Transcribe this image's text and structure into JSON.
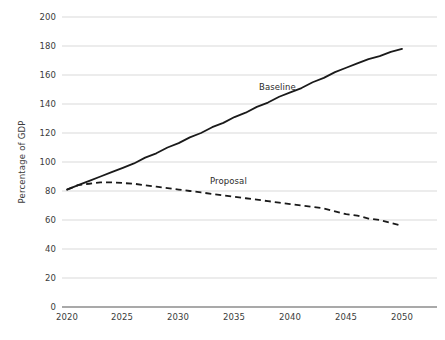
{
  "chart_data": {
    "type": "line",
    "title": "",
    "xlabel": "",
    "ylabel": "Percentage of GDP",
    "xlim": [
      2020,
      2050
    ],
    "ylim": [
      0,
      200
    ],
    "grid": true,
    "legend_position": "inline-annotation",
    "xticks": [
      "2020",
      "2025",
      "2030",
      "2035",
      "2040",
      "2045",
      "2050"
    ],
    "yticks": [
      "0",
      "20",
      "40",
      "60",
      "80",
      "100",
      "120",
      "140",
      "160",
      "180",
      "200"
    ],
    "x": [
      2020,
      2021,
      2022,
      2023,
      2024,
      2025,
      2026,
      2027,
      2028,
      2029,
      2030,
      2031,
      2032,
      2033,
      2034,
      2035,
      2036,
      2037,
      2038,
      2039,
      2040,
      2041,
      2042,
      2043,
      2044,
      2045,
      2046,
      2047,
      2048,
      2049,
      2050
    ],
    "series": [
      {
        "name": "Baseline",
        "style": "solid",
        "color": "#1a1a1a",
        "values": [
          81,
          84,
          87,
          90,
          93,
          96,
          99,
          103,
          106,
          110,
          113,
          117,
          120,
          124,
          127,
          131,
          134,
          138,
          141,
          145,
          148,
          151,
          155,
          158,
          162,
          165,
          168,
          171,
          173,
          176,
          178
        ]
      },
      {
        "name": "Proposal",
        "style": "dashed",
        "color": "#1a1a1a",
        "values": [
          81,
          84,
          85,
          86,
          86,
          85.5,
          85,
          84,
          83,
          82,
          81,
          80,
          79,
          78,
          77,
          76,
          75,
          74,
          73,
          72,
          71,
          70,
          69,
          68,
          66,
          64,
          63,
          61,
          60,
          58,
          56
        ]
      }
    ],
    "annotations": [
      {
        "text": "Baseline",
        "x_px": 259,
        "y_px": 82
      },
      {
        "text": "Proposal",
        "x_px": 210,
        "y_px": 176
      }
    ],
    "colors": {
      "gridline": "#d9d9d9",
      "axis": "#8c8c8c",
      "text": "#3b3b3b",
      "line": "#1a1a1a",
      "background": "#ffffff"
    }
  }
}
